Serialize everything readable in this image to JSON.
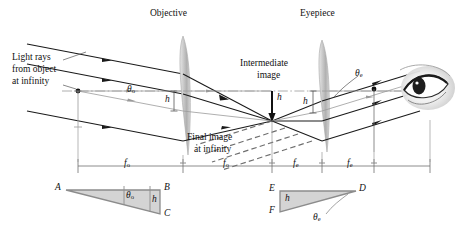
{
  "figure": {
    "type": "optics-ray-diagram",
    "background_color": "#ffffff",
    "ray_color": "#1a1a1a",
    "axis_color": "#9a9a9a",
    "lens_fill": "#bdbdbd",
    "dashed_ray_color": "#6e6e6e",
    "triangle_fill": "#d2d2d2",
    "triangle_stroke": "#8c8c8c"
  },
  "labels": {
    "objective": "Objective",
    "eyepiece": "Eyepiece",
    "light_rays_line1": "Light rays",
    "light_rays_line2": "from object",
    "light_rays_line3": "at infinity",
    "intermediate_line1": "Intermediate",
    "intermediate_line2": "image",
    "final_image_line1": "Final image",
    "final_image_line2": "at infinity",
    "theta_o": "θ",
    "theta_o_sub": "o",
    "theta_e": "θ",
    "theta_e_sub": "e",
    "h_objective": "h",
    "h_intermediate": "h",
    "h_eyepiece": "h"
  },
  "focal_lengths": {
    "f_o_left": "f",
    "f_o_left_sub": "o",
    "f_o_right": "f",
    "f_o_right_sub": "o",
    "f_e_left": "f",
    "f_e_left_sub": "e",
    "f_e_right": "f",
    "f_e_right_sub": "e"
  },
  "triangle_left": {
    "vertex_a": "A",
    "vertex_b": "B",
    "vertex_c": "C",
    "angle": "θ",
    "angle_sub": "o",
    "side_h": "h"
  },
  "triangle_right": {
    "vertex_d": "D",
    "vertex_e": "E",
    "vertex_f": "F",
    "angle": "θ",
    "angle_sub": "e",
    "side_h": "h"
  }
}
